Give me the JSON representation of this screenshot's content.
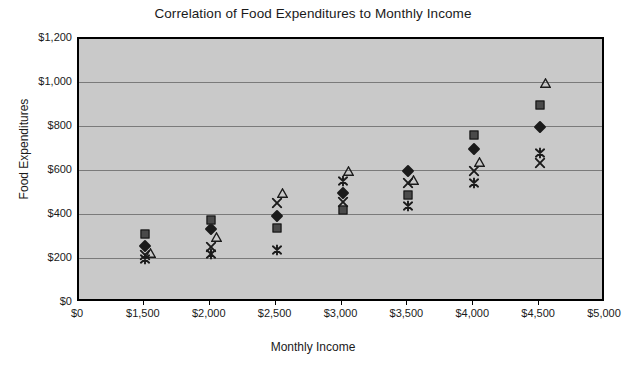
{
  "chart_data": {
    "type": "scatter",
    "title": "Correlation of Food Expenditures to Monthly Income",
    "xlabel": "Monthly Income",
    "ylabel": "Food Expenditures",
    "grid": true,
    "legend": "none",
    "x_axis_kind": "categorical",
    "x_tick_labels": [
      "$0",
      "$1,500",
      "$2,000",
      "$2,500",
      "$3,000",
      "$3,500",
      "$4,000",
      "$4,500",
      "$5,000"
    ],
    "y_tick_labels": [
      "$0",
      "$200",
      "$400",
      "$600",
      "$800",
      "$1,000",
      "$1,200"
    ],
    "y_tick_values": [
      0,
      200,
      400,
      600,
      800,
      1000,
      1200
    ],
    "ylim": [
      0,
      1200
    ],
    "categories": [
      "$1,500",
      "$2,000",
      "$2,500",
      "$3,000",
      "$3,500",
      "$4,000",
      "$4,500"
    ],
    "category_values": [
      1500,
      2000,
      2500,
      3000,
      3500,
      4000,
      4500
    ],
    "series": [
      {
        "name": "Series 1",
        "marker": "diamond",
        "color": "#1b1b1b",
        "values": [
          258,
          335,
          397,
          500,
          600,
          700,
          800
        ]
      },
      {
        "name": "Series 2",
        "marker": "square",
        "color": "#4a4a4a",
        "values": [
          312,
          378,
          343,
          425,
          490,
          765,
          900
        ]
      },
      {
        "name": "Series 3",
        "marker": "triangle",
        "color": "#1b1b1b",
        "values": [
          228,
          300,
          500,
          600,
          560,
          640,
          1000
        ]
      },
      {
        "name": "Series 4",
        "marker": "x",
        "color": "#1b1b1b",
        "values": [
          218,
          255,
          455,
          460,
          545,
          600,
          635
        ]
      },
      {
        "name": "Series 5",
        "marker": "asterisk",
        "color": "#1b1b1b",
        "values": [
          200,
          222,
          242,
          555,
          443,
          545,
          680
        ]
      }
    ],
    "colors": {
      "plot_background": "#c9c9c9",
      "page_background": "#ffffff",
      "gridline": "#7a7a7a",
      "axis": "#000000",
      "text": "#1a1a1a"
    }
  }
}
